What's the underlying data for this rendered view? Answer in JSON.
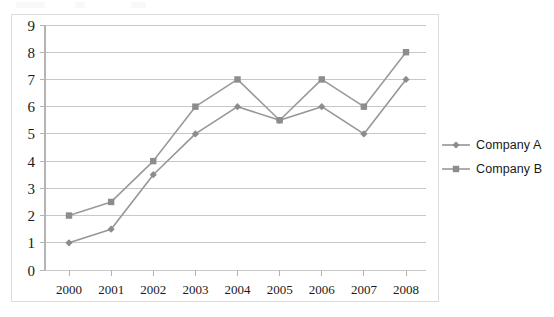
{
  "chart_data": {
    "type": "line",
    "title": "",
    "subtitle": "",
    "xlabel": "",
    "ylabel": "",
    "categories": [
      "2000",
      "2001",
      "2002",
      "2003",
      "2004",
      "2005",
      "2006",
      "2007",
      "2008"
    ],
    "series": [
      {
        "name": "Company A",
        "marker": "diamond",
        "color": "#969696",
        "values": [
          1,
          1.5,
          3.5,
          5,
          6,
          5.5,
          6,
          5,
          7
        ]
      },
      {
        "name": "Company B",
        "marker": "square",
        "color": "#9a9a9a",
        "values": [
          2,
          2.5,
          4,
          6,
          7,
          5.5,
          7,
          6,
          8
        ]
      }
    ],
    "ylim": [
      0,
      9
    ],
    "ytick_labels": [
      "0",
      "1",
      "2",
      "3",
      "4",
      "5",
      "6",
      "7",
      "8",
      "9"
    ],
    "ytick_values": [
      0,
      1,
      2,
      3,
      4,
      5,
      6,
      7,
      8,
      9
    ],
    "grid": true,
    "grid_axis": "y",
    "legend_position": "right",
    "legend_entries": [
      "Company A",
      "Company B"
    ]
  },
  "style": {
    "grid_color": "#c8c8c8",
    "axis_color": "#b4b4b4",
    "border_color": "#dcdcdc",
    "tick_label_color": "#1a1a1a",
    "plot_background": "#ffffff"
  },
  "axis": {
    "y_tick_label_fontsize": "15px",
    "x_tick_label_fontsize": "13px"
  }
}
